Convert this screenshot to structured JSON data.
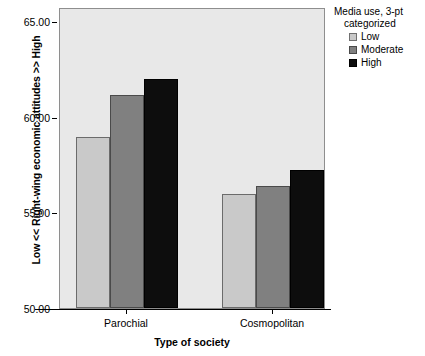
{
  "chart_data": {
    "type": "bar",
    "title": "",
    "xlabel": "Type of society",
    "ylabel": "Low << Right-wing economic attitudes >> High",
    "categories": [
      "Parochial",
      "Cosmopolitan"
    ],
    "series": [
      {
        "name": "Low",
        "values": [
          58.6,
          55.7
        ],
        "color": "#c9c9c9"
      },
      {
        "name": "Moderate",
        "values": [
          60.7,
          56.1
        ],
        "color": "#808080"
      },
      {
        "name": "High",
        "values": [
          61.5,
          56.9
        ],
        "color": "#0d0d0d"
      }
    ],
    "ylim": [
      50.0,
      65.0
    ],
    "ytick_labels": [
      "65.00",
      "60.00",
      "55.00",
      "50.00"
    ],
    "ytick_values": [
      65.0,
      60.0,
      55.0,
      50.0
    ],
    "grid": false,
    "legend_position": "right",
    "legend_title": "Media use, 3-pt categorized",
    "plot_background": "#e8e8e8"
  },
  "legend": {
    "title_line1": "Media use, 3-pt",
    "title_line2": "categorized",
    "items": [
      {
        "label": "Low"
      },
      {
        "label": "Moderate"
      },
      {
        "label": "High"
      }
    ]
  },
  "axes": {
    "y_title": "Low << Right-wing economic attitudes >> High",
    "x_title": "Type of society",
    "y_ticks": [
      {
        "label": "65.00"
      },
      {
        "label": "60.00"
      },
      {
        "label": "55.00"
      },
      {
        "label": "50.00"
      }
    ],
    "x_ticks": [
      {
        "label": "Parochial"
      },
      {
        "label": "Cosmopolitan"
      }
    ]
  }
}
